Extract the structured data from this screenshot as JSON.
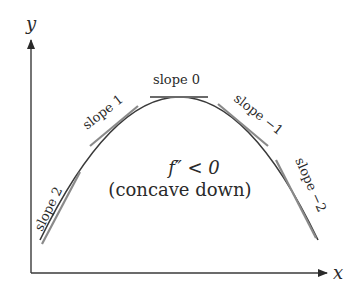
{
  "diagram": {
    "axes": {
      "x_label": "x",
      "y_label": "y"
    },
    "curve": {
      "description": "downward-opening parabola",
      "color": "#3a3a3a"
    },
    "tangent_color": "#8a8a8a",
    "tangents": [
      {
        "label": "slope 2",
        "slope": 2
      },
      {
        "label": "slope 1",
        "slope": 1
      },
      {
        "label": "slope 0",
        "slope": 0
      },
      {
        "label": "slope −1",
        "slope": -1
      },
      {
        "label": "slope −2",
        "slope": -2
      }
    ],
    "annotation": {
      "line1": "f″ < 0",
      "line2": "(concave down)"
    }
  }
}
